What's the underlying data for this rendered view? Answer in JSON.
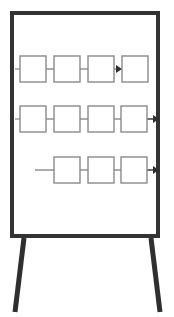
{
  "scene": {
    "title": "Flipchart easel with process flow diagram",
    "background_color": "#ffffff",
    "width": 174,
    "height": 317
  },
  "easel": {
    "name": "flipchart-easel",
    "frame": {
      "label": "whiteboard-frame",
      "x": 10,
      "y": 11,
      "width": 150,
      "height": 227,
      "stroke_color": "#333333",
      "stroke_width": 4,
      "fill_color": "#ffffff"
    },
    "legs": [
      {
        "label": "left-leg",
        "top_x": 24,
        "top_y": 238,
        "bottom_x": 15,
        "bottom_y": 312,
        "color": "#2f2f2f",
        "width": 5
      },
      {
        "label": "right-leg",
        "top_x": 151,
        "top_y": 238,
        "bottom_x": 160,
        "bottom_y": 312,
        "color": "#2f2f2f",
        "width": 5
      }
    ]
  },
  "diagram": {
    "type": "flowchart",
    "box_stroke_color": "#8a8a8a",
    "box_fill_color": "#ffffff",
    "box_stroke_width": 1.4,
    "connector_color": "#8a8a8a",
    "connector_width": 1.4,
    "arrow_color": "#2f2f2f",
    "box_size": 26,
    "rows": [
      {
        "label": "row-1",
        "y": 56,
        "box_count": 4,
        "box_x": [
          20,
          54,
          88,
          122
        ],
        "lead_in": {
          "present": true,
          "from_x": 15,
          "to_x": 20,
          "color": "#9a9a9a"
        },
        "connectors": [
          {
            "from_x": 46,
            "to_x": 54
          },
          {
            "from_x": 80,
            "to_x": 88
          },
          {
            "from_x": 114,
            "to_x": 120
          }
        ],
        "arrows": [
          {
            "label": "arrow-into-box-4",
            "tip_x": 122,
            "y": 69
          }
        ],
        "end_arrow": false
      },
      {
        "label": "row-2",
        "y": 106,
        "box_count": 4,
        "box_x": [
          20,
          54,
          88,
          121
        ],
        "lead_in": {
          "present": true,
          "from_x": 15,
          "to_x": 20,
          "color": "#9a9a9a"
        },
        "connectors": [
          {
            "from_x": 46,
            "to_x": 54
          },
          {
            "from_x": 80,
            "to_x": 88
          },
          {
            "from_x": 114,
            "to_x": 121
          }
        ],
        "arrows": [
          {
            "label": "arrow-row-2-out",
            "tip_x": 159,
            "y": 119
          }
        ],
        "end_arrow": true,
        "end_line": {
          "from_x": 147,
          "to_x": 154
        }
      },
      {
        "label": "row-3",
        "y": 157,
        "box_count": 3,
        "box_x": [
          54,
          88,
          121
        ],
        "lead_in": {
          "present": true,
          "from_x": 35,
          "to_x": 54,
          "color": "#8a8a8a"
        },
        "connectors": [
          {
            "from_x": 80,
            "to_x": 88
          },
          {
            "from_x": 114,
            "to_x": 121
          }
        ],
        "arrows": [
          {
            "label": "arrow-row-3-out",
            "tip_x": 159,
            "y": 170
          }
        ],
        "end_arrow": true,
        "end_line": {
          "from_x": 147,
          "to_x": 154
        }
      }
    ]
  },
  "chart_data": {
    "type": "diagram",
    "lanes": [
      {
        "name": "row-1",
        "nodes": [
          "",
          "",
          "",
          ""
        ],
        "node_count": 4,
        "terminal_arrow": false,
        "internal_arrow_before_last": true
      },
      {
        "name": "row-2",
        "nodes": [
          "",
          "",
          "",
          ""
        ],
        "node_count": 4,
        "terminal_arrow": true,
        "internal_arrow_before_last": false
      },
      {
        "name": "row-3",
        "nodes": [
          "",
          "",
          ""
        ],
        "node_count": 3,
        "terminal_arrow": true,
        "internal_arrow_before_last": false
      }
    ],
    "total_nodes": 11,
    "labels_present": false
  }
}
